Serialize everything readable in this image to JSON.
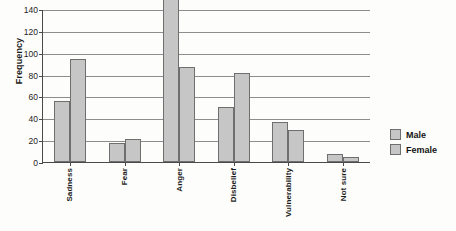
{
  "chart_data": {
    "type": "bar",
    "title": "",
    "xlabel": "",
    "ylabel": "Frequency",
    "ylim": [
      0,
      140
    ],
    "ytick_step": 20,
    "yticks": [
      "0",
      "20",
      "40",
      "60",
      "80",
      "100",
      "120",
      "140"
    ],
    "grid": "horizontal",
    "legend_position": "right",
    "note": "Male bar for Anger is clipped at the 140 axis maximum",
    "categories": [
      "Sadness",
      "Fear",
      "Anger",
      "Disbelief",
      "Vulnerability",
      "Not sure"
    ],
    "series": [
      {
        "name": "Male",
        "values": [
          56,
          17,
          140,
          50,
          37,
          7
        ]
      },
      {
        "name": "Female",
        "values": [
          94,
          21,
          87,
          81,
          29,
          5
        ]
      }
    ]
  },
  "legend": {
    "items": [
      {
        "label": "Male",
        "color": "#c6c6c6"
      },
      {
        "label": "Female",
        "color": "#c6c6c6"
      }
    ]
  },
  "colors": {
    "bar_fill": "#c6c6c6",
    "bar_stroke": "#6f6f6f",
    "axis": "#4a4a4a",
    "gridline": "#8d8d8d",
    "text": "#1c1c1c",
    "background": "#fdfdfb"
  }
}
